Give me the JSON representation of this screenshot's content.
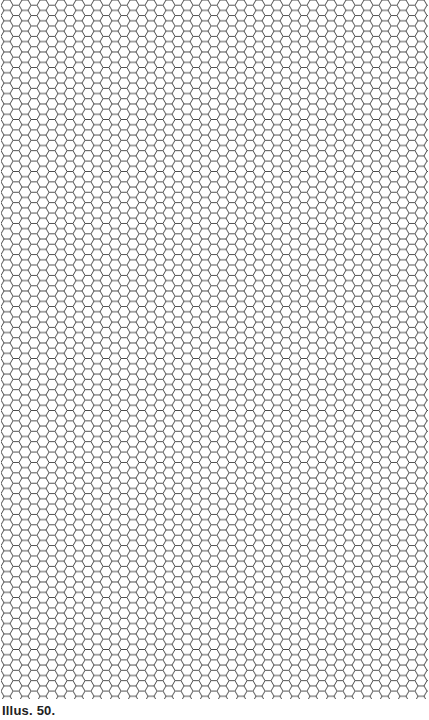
{
  "figure": {
    "caption": "Illus. 50.",
    "pattern": "hexagon-grid",
    "line_color": "#3a3a3a",
    "background": "#ffffff"
  }
}
